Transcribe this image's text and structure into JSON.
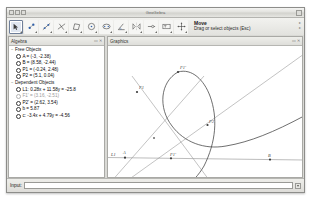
{
  "window": {
    "title": "GeoGebra",
    "titlebar_dots": [
      "dot-1",
      "dot-2",
      "dot-3"
    ]
  },
  "toolbar": {
    "tools": [
      {
        "name": "move-tool",
        "icon": "arrow-cursor-icon",
        "selected": true
      },
      {
        "name": "point-tool",
        "icon": "new-point-icon",
        "selected": false
      },
      {
        "name": "line-tool",
        "icon": "line-through-two-points-icon",
        "selected": false
      },
      {
        "name": "perpendicular-tool",
        "icon": "perpendicular-line-icon",
        "selected": false
      },
      {
        "name": "polygon-tool",
        "icon": "polygon-icon",
        "selected": false
      },
      {
        "name": "circle-tool",
        "icon": "circle-center-point-icon",
        "selected": false
      },
      {
        "name": "conic-tool",
        "icon": "ellipse-icon",
        "selected": false
      },
      {
        "name": "angle-tool",
        "icon": "angle-icon",
        "selected": false
      },
      {
        "name": "reflect-tool",
        "icon": "reflect-object-icon",
        "selected": false
      },
      {
        "name": "slider-tool",
        "icon": "slider-icon",
        "selected": false
      },
      {
        "name": "text-tool",
        "icon": "insert-text-icon",
        "selected": false
      },
      {
        "name": "move-view-tool",
        "icon": "move-graphics-view-icon",
        "selected": false
      }
    ],
    "tip_title": "Move",
    "tip_sub": "Drag or select objects (Esc)",
    "help_marks": [
      "▸",
      "▸"
    ]
  },
  "algebra": {
    "panel_title": "Algebra",
    "panel_buttons": [
      "▭",
      "✕"
    ],
    "groups": [
      {
        "name": "free-objects",
        "twisty": "−",
        "label": "Free Objects",
        "items": [
          {
            "text": "A = (-3, -2.38)",
            "dim": false
          },
          {
            "text": "B = (8.58, -2.44)",
            "dim": false
          },
          {
            "text": "P1 = (-0.24, 2.48)",
            "dim": false
          },
          {
            "text": "P2 = (5.1, 0.04)",
            "dim": false
          }
        ]
      },
      {
        "name": "dependent-objects",
        "twisty": "−",
        "label": "Dependent Objects",
        "items": [
          {
            "text": "L1: 0.28x + 11.58y = -25.8",
            "dim": false
          },
          {
            "text": "F1' = (3.16, -2.51)",
            "dim": true
          },
          {
            "text": "P2' = (2.62, 3.54)",
            "dim": false
          },
          {
            "text": "b = 5.87",
            "dim": false
          },
          {
            "text": "c: -3.4x + 4.79y = -4.56",
            "dim": false
          }
        ]
      }
    ]
  },
  "graphics": {
    "panel_title": "Graphics",
    "panel_buttons": [
      "▭",
      "✕"
    ],
    "point_labels": [
      {
        "name": "label-F1-prime-top",
        "text": "F1'",
        "x": 71,
        "y": 23
      },
      {
        "name": "label-F1",
        "text": "F1",
        "x": 31,
        "y": 42
      },
      {
        "name": "label-P2",
        "text": "P2",
        "x": 101,
        "y": 76
      },
      {
        "name": "label-L1",
        "text": "L1",
        "x": 4,
        "y": 110
      },
      {
        "name": "label-A",
        "text": "A",
        "x": 15,
        "y": 108
      },
      {
        "name": "label-F1-prime-axis",
        "text": "F1'",
        "x": 62,
        "y": 110
      },
      {
        "name": "label-B",
        "text": "B",
        "x": 160,
        "y": 109
      }
    ]
  },
  "input": {
    "label": "Input:",
    "value": "",
    "placeholder": "",
    "dropdown_icon": "chevron-down-icon"
  },
  "colors": {
    "window_chrome": "#e8e8e6",
    "panel_bg": "#ffffff",
    "curve_stroke": "#4a4a4a",
    "line_stroke": "#8a8a8a",
    "text": "#0a0a0a",
    "dim_text": "#9a9a9a"
  }
}
